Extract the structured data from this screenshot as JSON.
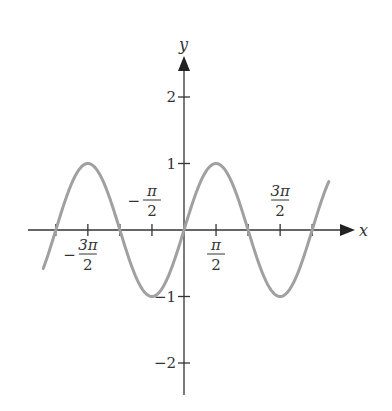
{
  "chart_data": {
    "type": "line",
    "title": "",
    "function": "y = sin(x)",
    "xlabel": "x",
    "ylabel": "y",
    "x_range": [
      -4.4,
      4.5
    ],
    "ylim": [
      -2.3,
      2.6
    ],
    "grid": false,
    "legend": null,
    "x_ticks": [
      {
        "value": -6.2832,
        "label": ""
      },
      {
        "value": -4.7124,
        "label": "-3π/2",
        "num": "3π",
        "den": "2",
        "sign": "−"
      },
      {
        "value": -3.1416,
        "label": ""
      },
      {
        "value": -1.5708,
        "label": "-π/2",
        "num": "π",
        "den": "2",
        "sign": "−"
      },
      {
        "value": 1.5708,
        "label": "π/2",
        "num": "π",
        "den": "2",
        "sign": ""
      },
      {
        "value": 3.1416,
        "label": ""
      },
      {
        "value": 4.7124,
        "label": "3π/2",
        "num": "3π",
        "den": "2",
        "sign": ""
      },
      {
        "value": 6.2832,
        "label": ""
      }
    ],
    "y_ticks": [
      {
        "value": 2,
        "label": "2"
      },
      {
        "value": 1,
        "label": "1"
      },
      {
        "value": -1,
        "label": "−1"
      },
      {
        "value": -2,
        "label": "−2"
      }
    ],
    "series": [
      {
        "name": "sin x",
        "color": "#a0a0a0",
        "x": [
          -6.9,
          -6.2832,
          -4.7124,
          -3.1416,
          -1.5708,
          0,
          1.5708,
          3.1416,
          4.7124,
          6.2832,
          7.1
        ],
        "y": [
          -0.58,
          0,
          1,
          0,
          -1,
          0,
          1,
          0,
          -1,
          0,
          0.73
        ]
      }
    ]
  },
  "labels": {
    "x_axis": "x",
    "y_axis": "y"
  },
  "colors": {
    "axis": "#333333",
    "curve": "#a0a0a0"
  }
}
